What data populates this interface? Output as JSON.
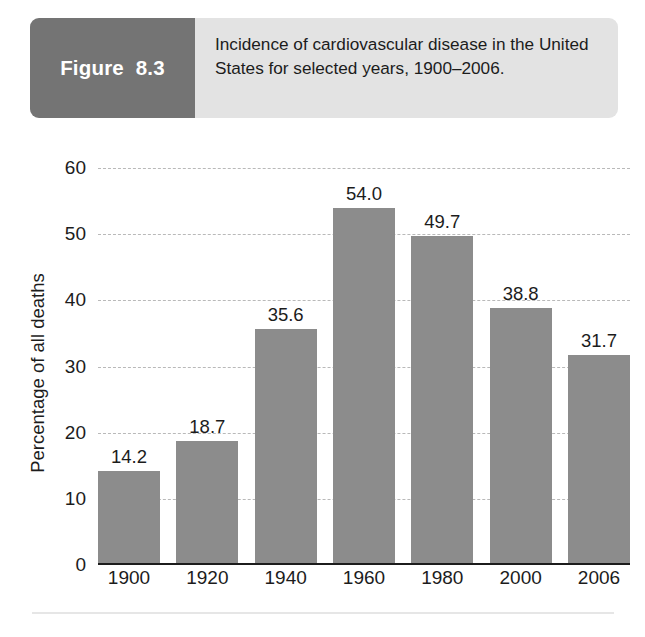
{
  "figure": {
    "number_label": "Figure  8.3",
    "caption": "Incidence of cardiovascular disease in the United States for selected years, 1900–2006."
  },
  "chart_data": {
    "type": "bar",
    "title": "Incidence of cardiovascular disease in the United States for selected years, 1900–2006.",
    "categories": [
      "1900",
      "1920",
      "1940",
      "1960",
      "1980",
      "2000",
      "2006"
    ],
    "values": [
      14.2,
      18.7,
      35.6,
      54.0,
      49.7,
      38.8,
      31.7
    ],
    "value_labels": [
      "14.2",
      "18.7",
      "35.6",
      "54.0",
      "49.7",
      "38.8",
      "31.7"
    ],
    "xlabel": "",
    "ylabel": "Percentage of all deaths",
    "ylim": [
      0,
      60
    ],
    "ytick_labels": [
      "60",
      "50",
      "40",
      "30",
      "20",
      "10",
      "0"
    ],
    "ytick_values": [
      60,
      50,
      40,
      30,
      20,
      10,
      0
    ],
    "grid": true,
    "grid_style": "dashed",
    "legend": "none",
    "bar_color": "#8c8c8c",
    "grid_color": "#b9b9b9",
    "axis_color": "#1c1c1c"
  },
  "colors": {
    "figure_number_bg": "#747474",
    "caption_bg": "#e3e3e3",
    "page_bg": "#ffffff"
  }
}
